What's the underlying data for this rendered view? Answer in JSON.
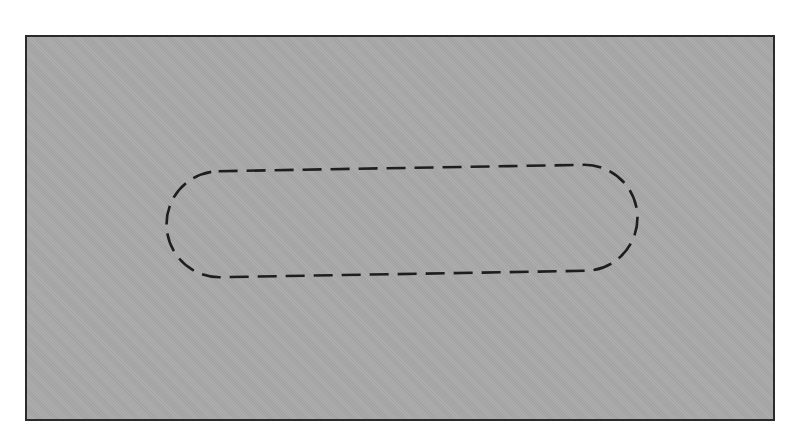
{
  "figure": {
    "background_color": "#ffffff",
    "panel": {
      "fill_color": "#a9a9a9",
      "border_color": "#2a2a2a",
      "x": 25,
      "y": 35,
      "width": 748,
      "height": 384
    },
    "slot_outline": {
      "shape": "stadium",
      "stroke_color": "#1e1e1e",
      "stroke_style": "dashed",
      "center_x": 402,
      "center_y": 221,
      "width": 471,
      "height": 106,
      "rotation_deg": -1
    }
  }
}
